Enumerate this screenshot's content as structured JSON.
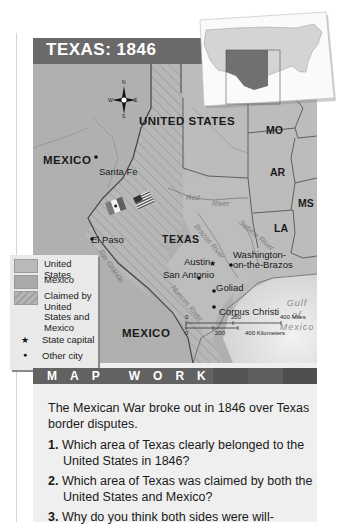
{
  "map": {
    "title": "TEXAS: 1846",
    "compass": {
      "n": "N",
      "s": "S",
      "e": "E",
      "w": "W"
    },
    "regions": {
      "united_states": "UNITED STATES",
      "mexico_north": "MEXICO",
      "mexico_south": "MEXICO",
      "texas": "TEXAS"
    },
    "states": [
      "MO",
      "AR",
      "MS",
      "LA"
    ],
    "cities": [
      {
        "name": "Santa Fe",
        "type": "Other city"
      },
      {
        "name": "El Paso",
        "type": "Other city"
      },
      {
        "name": "Austin",
        "type": "State capital"
      },
      {
        "name": "San Antonio",
        "type": "Other city"
      },
      {
        "name": "Washington-on-the-Brazos",
        "type": "Other city"
      },
      {
        "name": "Goliad",
        "type": "Other city"
      },
      {
        "name": "Corpus Christi",
        "type": "Other city"
      }
    ],
    "city_labels": {
      "santa_fe": "Santa Fe",
      "el_paso": "El Paso",
      "austin": "Austin",
      "san_antonio": "San Antonio",
      "washington_1": "Washington-",
      "washington_2": "on-the-Brazos",
      "goliad": "Goliad",
      "corpus_christi": "Corpus Christi"
    },
    "rivers": {
      "red_1": "Red",
      "red_2": "River",
      "brazos": "Brazos River",
      "sabine": "Sabine River",
      "rio_grande": "Rio Grande",
      "nueces": "Nueces River"
    },
    "gulf": [
      "Gulf",
      "of",
      "Mexico"
    ],
    "scale": {
      "miles": [
        "0",
        "200",
        "400 Miles"
      ],
      "km": [
        "0",
        "200",
        "400 Kilometers"
      ]
    },
    "flags": [
      "Mexico flag",
      "United States flag"
    ]
  },
  "legend": {
    "items": [
      {
        "label": "United States",
        "color": "#b9b9b9"
      },
      {
        "label": "Mexico",
        "color": "#a9a9a9"
      },
      {
        "label": "Claimed by United States and Mexico",
        "color": "#b2b2b2",
        "pattern": "hatched"
      },
      {
        "label": "State capital",
        "symbol": "★"
      },
      {
        "label": "Other city",
        "symbol": "●"
      }
    ]
  },
  "map_work": {
    "heading": "MAP WORK",
    "intro": "The Mexican War broke out in 1846 over Texas border disputes.",
    "questions": [
      {
        "num": "1.",
        "text": "Which area of Texas clearly belonged to the United States in 1846?"
      },
      {
        "num": "2.",
        "text": "Which area of Texas was claimed by both the United States and Mexico?"
      },
      {
        "num": "3.",
        "text": "Why do you think both sides were will-"
      }
    ]
  },
  "colors": {
    "title_bar": "#6a6a6a",
    "map_work_bar": "#5f5f5f",
    "us_land": "#b9b9b9",
    "mexico_land": "#a9a9a9",
    "gulf_water": "#e4e4e4",
    "inset_highlight": "#7b7b7b"
  }
}
